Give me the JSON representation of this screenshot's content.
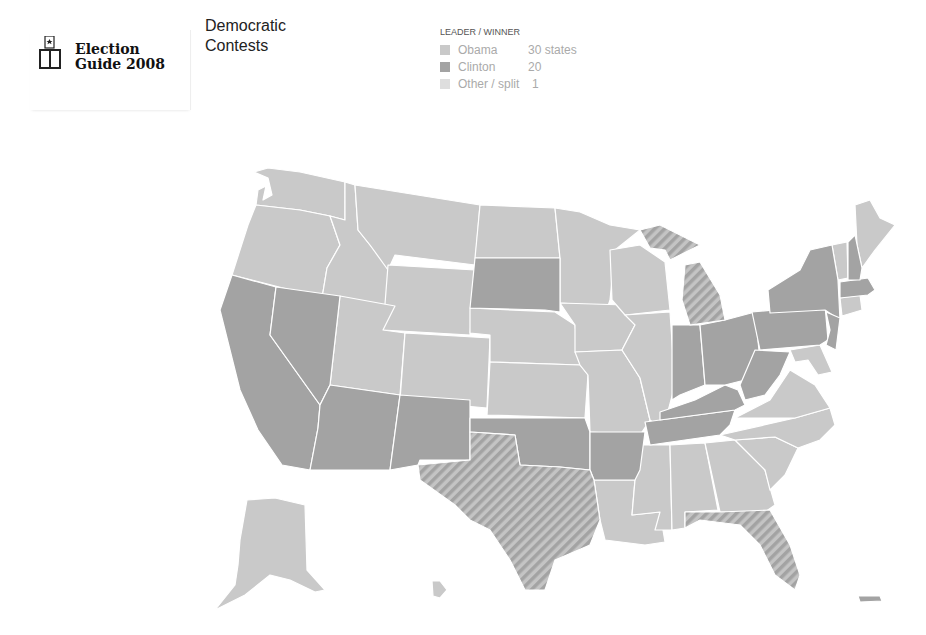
{
  "header": {
    "logo_year_digits": "08",
    "logo_line1": "Election",
    "logo_line2": "Guide 2008",
    "title_line1": "Democratic",
    "title_line2": "Contests"
  },
  "legend": {
    "heading": "LEADER / WINNER",
    "items": [
      {
        "label": "Obama",
        "value": "30 states",
        "color": "#c9c9c9"
      },
      {
        "label": "Clinton",
        "value": "20",
        "color": "#a3a3a3"
      },
      {
        "label": "Other / split",
        "value": "1",
        "color": "#dedede"
      }
    ]
  },
  "colors": {
    "obama": "#c9c9c9",
    "clinton": "#a3a3a3",
    "split": "#b5b5b5",
    "border": "#ffffff"
  },
  "map": {
    "obama_states": [
      "WA",
      "OR",
      "ID",
      "MT",
      "WY",
      "UT",
      "CO",
      "ND",
      "NE",
      "KS",
      "MN",
      "IA",
      "MO",
      "WI",
      "IL",
      "LA",
      "MS",
      "AL",
      "GA",
      "SC",
      "NC",
      "VA",
      "MD",
      "DE",
      "CT",
      "VT",
      "ME",
      "AK",
      "HI",
      "DC"
    ],
    "clinton_states": [
      "CA",
      "NV",
      "AZ",
      "NM",
      "SD",
      "OK",
      "AR",
      "TN",
      "KY",
      "IN",
      "OH",
      "WV",
      "PA",
      "NY",
      "NJ",
      "MA",
      "NH",
      "RI",
      "PR"
    ],
    "split_states": [
      "TX",
      "MI",
      "FL"
    ]
  }
}
